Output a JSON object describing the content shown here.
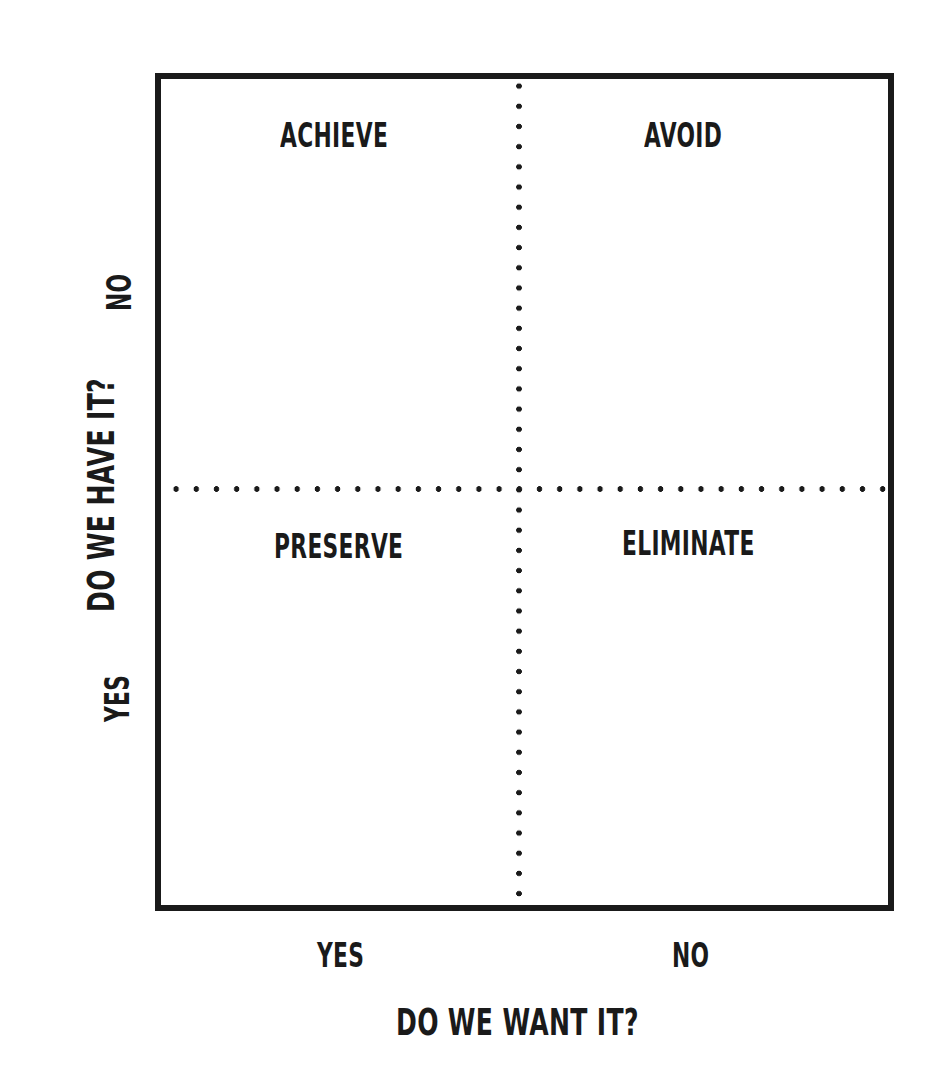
{
  "diagram": {
    "type": "2x2-matrix",
    "quadrants": {
      "top_left": "ACHIEVE",
      "top_right": "AVOID",
      "bottom_left": "PRESERVE",
      "bottom_right": "ELIMINATE"
    },
    "x_axis": {
      "title": "DO WE WANT IT?",
      "left_label": "YES",
      "right_label": "NO"
    },
    "y_axis": {
      "title": "DO WE HAVE IT?",
      "top_label": "NO",
      "bottom_label": "YES"
    },
    "colors": {
      "ink": "#1a1a1a",
      "background": "#ffffff"
    }
  }
}
